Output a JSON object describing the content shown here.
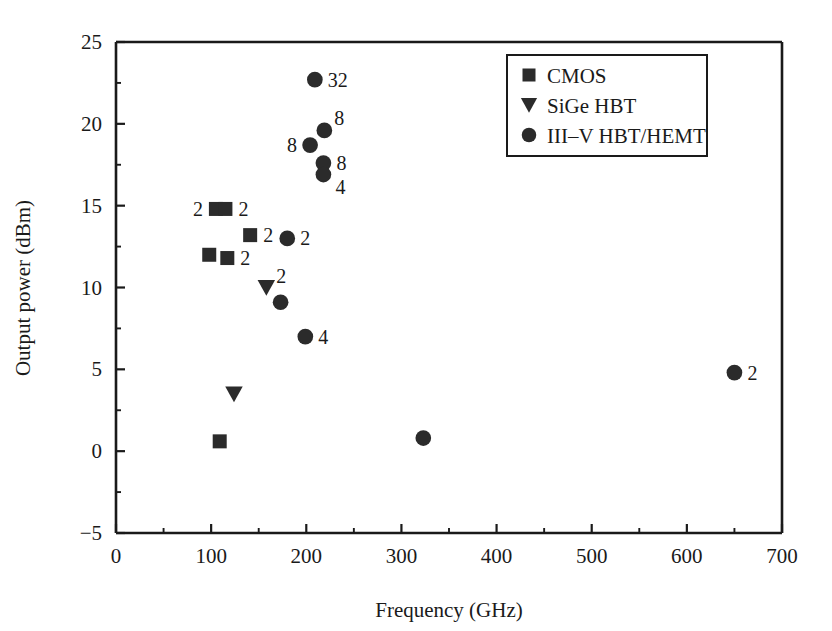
{
  "chart_data": {
    "type": "scatter",
    "title": "",
    "xlabel": "Frequency (GHz)",
    "ylabel": "Output power (dBm)",
    "xlim": [
      0,
      700
    ],
    "ylim": [
      -5,
      25
    ],
    "xticks": [
      0,
      100,
      200,
      300,
      400,
      500,
      600,
      700
    ],
    "xtick_labels": [
      "0",
      "100",
      "200",
      "300",
      "400",
      "500",
      "600",
      "700"
    ],
    "x_minor_interval": 50,
    "yticks": [
      -5,
      0,
      5,
      10,
      15,
      20,
      25
    ],
    "ytick_labels": [
      "−5",
      "0",
      "5",
      "10",
      "15",
      "20",
      "25"
    ],
    "y_minor_interval": 2.5,
    "grid": false,
    "legend_position": "top-center-right",
    "series": [
      {
        "name": "CMOS",
        "marker": "square",
        "points": [
          {
            "x": 109,
            "y": 0.6,
            "label": "",
            "label_side": "none"
          },
          {
            "x": 98,
            "y": 12.0,
            "label": "",
            "label_side": "none"
          },
          {
            "x": 117,
            "y": 11.8,
            "label": "2",
            "label_side": "right"
          },
          {
            "x": 105,
            "y": 14.8,
            "label": "2",
            "label_side": "left"
          },
          {
            "x": 115,
            "y": 14.8,
            "label": "2",
            "label_side": "right"
          },
          {
            "x": 141,
            "y": 13.2,
            "label": "2",
            "label_side": "right"
          }
        ]
      },
      {
        "name": "SiGe HBT",
        "marker": "triangle-down",
        "points": [
          {
            "x": 124,
            "y": 3.5,
            "label": "",
            "label_side": "none"
          },
          {
            "x": 158,
            "y": 10.0,
            "label": "2",
            "label_side": "upper-right"
          }
        ]
      },
      {
        "name": "III–V HBT/HEMT",
        "marker": "circle",
        "points": [
          {
            "x": 173,
            "y": 9.1,
            "label": "",
            "label_side": "none"
          },
          {
            "x": 180,
            "y": 13.0,
            "label": "2",
            "label_side": "right"
          },
          {
            "x": 199,
            "y": 7.0,
            "label": "4",
            "label_side": "right"
          },
          {
            "x": 209,
            "y": 22.7,
            "label": "32",
            "label_side": "right"
          },
          {
            "x": 204,
            "y": 18.7,
            "label": "8",
            "label_side": "left"
          },
          {
            "x": 219,
            "y": 19.6,
            "label": "8",
            "label_side": "upper-right"
          },
          {
            "x": 218,
            "y": 17.6,
            "label": "8",
            "label_side": "right"
          },
          {
            "x": 218,
            "y": 16.9,
            "label": "4",
            "label_side": "lower-right"
          },
          {
            "x": 323,
            "y": 0.8,
            "label": "",
            "label_side": "none"
          },
          {
            "x": 650,
            "y": 4.8,
            "label": "2",
            "label_side": "right"
          }
        ]
      }
    ],
    "legend_entries": [
      {
        "marker": "square",
        "label": "CMOS"
      },
      {
        "marker": "triangle-down",
        "label": "SiGe HBT"
      },
      {
        "marker": "circle",
        "label": "III–V HBT/HEMT"
      }
    ],
    "colors": {
      "marker": "#2b2b2b",
      "axis": "#1a1a1a",
      "background": "#ffffff"
    }
  }
}
